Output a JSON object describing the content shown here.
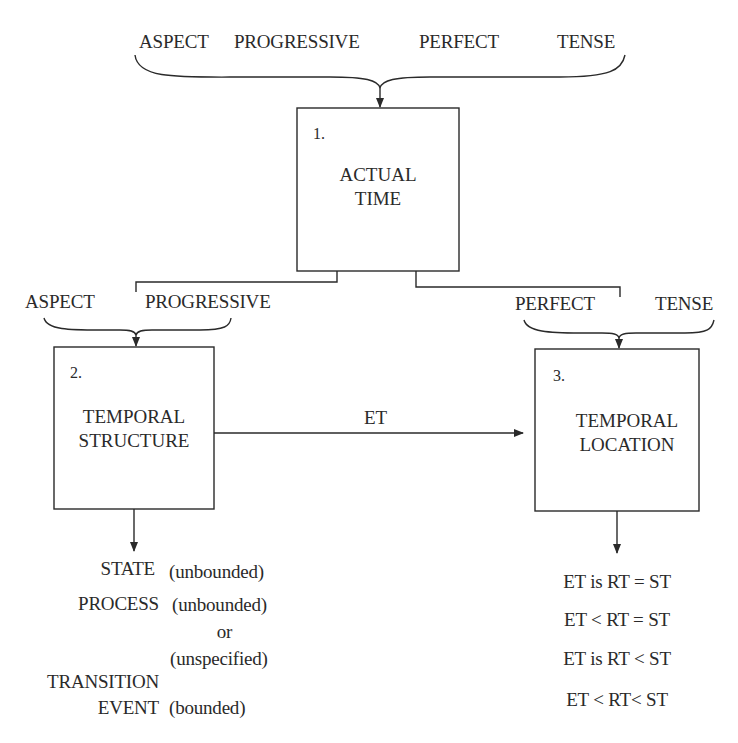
{
  "top_categories": [
    "ASPECT",
    "PROGRESSIVE",
    "PERFECT",
    "TENSE"
  ],
  "boxes": [
    {
      "number": "1.",
      "title_line1": "ACTUAL",
      "title_line2": "TIME"
    },
    {
      "number": "2.",
      "title_line1": "TEMPORAL",
      "title_line2": "STRUCTURE"
    },
    {
      "number": "3.",
      "title_line1": "TEMPORAL",
      "title_line2": "LOCATION"
    }
  ],
  "left_branch": {
    "labels": [
      "ASPECT",
      "PROGRESSIVE"
    ]
  },
  "right_branch": {
    "labels": [
      "PERFECT",
      "TENSE"
    ]
  },
  "connector_label": "ET",
  "structure_outputs": [
    {
      "term": "STATE",
      "note": "(unbounded)"
    },
    {
      "term": "PROCESS",
      "note": "(unbounded)"
    },
    {
      "term": "",
      "note": "or"
    },
    {
      "term": "",
      "note": "(unspecified)"
    },
    {
      "term": "TRANSITION",
      "note": ""
    },
    {
      "term": "EVENT",
      "note": "(bounded)"
    }
  ],
  "location_outputs": [
    "ET is RT = ST",
    "ET < RT = ST",
    "ET is RT < ST",
    "ET < RT< ST"
  ],
  "colors": {
    "ink": "#2a2a2a",
    "background": "#ffffff"
  }
}
